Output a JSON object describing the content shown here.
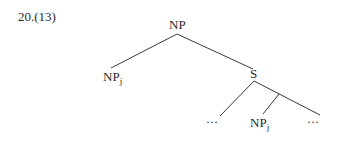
{
  "example_number": "20.(13)",
  "tree": {
    "root": {
      "label": "NP"
    },
    "left_child": {
      "label": "NP",
      "subscript": "j"
    },
    "right_child": {
      "label": "S"
    },
    "s_children": [
      {
        "label": "…"
      },
      {
        "label": "NP",
        "subscript": "j"
      },
      {
        "label": "…"
      }
    ]
  },
  "colors": {
    "text": "#2a2a2a",
    "line": "#3a3a3a",
    "background": "#ffffff"
  }
}
